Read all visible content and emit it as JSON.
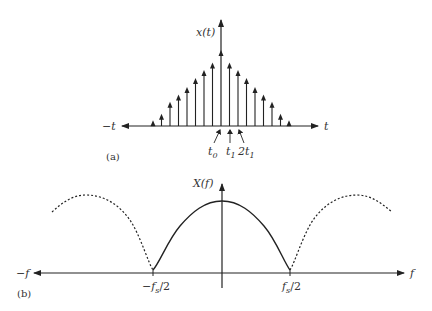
{
  "chart_data": [
    {
      "type": "stem",
      "panel_label": "(a)",
      "title": "",
      "ylabel": "x(t)",
      "xlabel_pos": "t",
      "xlabel_neg": "−t",
      "annotations": [
        "t0",
        "t1",
        "2t1"
      ],
      "grid": false,
      "description": "Sampled triangular pulse: impulse train whose amplitudes decrease linearly away from t = 0",
      "x": [
        -8,
        -7,
        -6,
        -5,
        -4,
        -3,
        -2,
        -1,
        0,
        1,
        2,
        3,
        4,
        5,
        6,
        7,
        8
      ],
      "values": [
        0.05,
        0.14,
        0.3,
        0.4,
        0.5,
        0.62,
        0.73,
        0.83,
        1.0,
        0.83,
        0.73,
        0.62,
        0.5,
        0.4,
        0.3,
        0.14,
        0.05
      ]
    },
    {
      "type": "line",
      "panel_label": "(b)",
      "title": "",
      "ylabel": "X(f)",
      "xlabel_pos": "f",
      "xlabel_neg": "−f",
      "tick_labels": [
        "−fs/2",
        "fs/2"
      ],
      "grid": false,
      "description": "Spectrum: solid main lobe between −fs/2 and fs/2, dashed periodic repetitions outside",
      "series": [
        {
          "name": "baseband (solid)",
          "x": [
            -0.5,
            -0.4,
            -0.3,
            -0.2,
            -0.1,
            0,
            0.1,
            0.2,
            0.3,
            0.4,
            0.5
          ],
          "values": [
            0.0,
            0.3,
            0.6,
            0.82,
            0.96,
            1.0,
            0.96,
            0.82,
            0.6,
            0.3,
            0.0
          ]
        },
        {
          "name": "replica left (dashed)",
          "x": [
            -1.0,
            -0.9,
            -0.8,
            -0.7,
            -0.6,
            -0.5
          ],
          "values": [
            0.8,
            1.0,
            0.9,
            0.6,
            0.3,
            0.0
          ]
        },
        {
          "name": "replica right (dashed)",
          "x": [
            0.5,
            0.6,
            0.7,
            0.8,
            0.9,
            1.0
          ],
          "values": [
            0.0,
            0.3,
            0.6,
            0.9,
            1.0,
            0.8
          ]
        }
      ]
    }
  ],
  "labels": {
    "a": {
      "ylabel": "x(t)",
      "neg": "−t",
      "pos": "t",
      "t0": "t",
      "t0_sub": "0",
      "t1": "t",
      "t1_sub": "1",
      "t2": "2t",
      "t2_sub": "1",
      "panel": "(a)"
    },
    "b": {
      "ylabel": "X(f)",
      "neg": "−f",
      "pos": "f",
      "left_tick": "−f",
      "left_tick_sub": "s",
      "left_tick_tail": "/2",
      "right_tick": "f",
      "right_tick_sub": "s",
      "right_tick_tail": "/2",
      "panel": "(b)"
    }
  },
  "colors": {
    "ink": "#222222",
    "background": "#ffffff"
  }
}
